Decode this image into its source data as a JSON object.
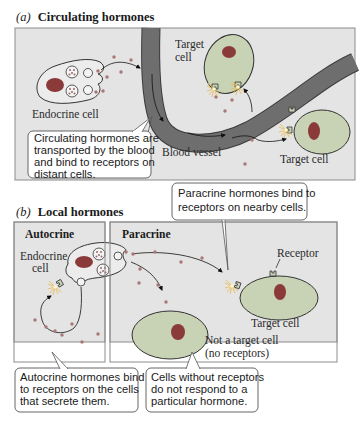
{
  "colors": {
    "panel_bg": "#e4e4e4",
    "panel_border": "#8c8c8c",
    "vessel": "#6e6e6e",
    "vessel_edge": "#3c3c3c",
    "cell_fill": "#c8d2b4",
    "endocrine_fill": "#ececec",
    "nucleus": "#8b3a3a",
    "hormone_dot": "#a87878",
    "callout_bg": "#ffffff",
    "callout_border": "#555555",
    "burst": "#f0c060"
  },
  "panel_a": {
    "letter": "(a)",
    "title": "Circulating hormones",
    "labels": {
      "endocrine_cell": "Endocrine cell",
      "target_cell_top_line1": "Target",
      "target_cell_top_line2": "cell",
      "blood_vessel": "Blood vessel",
      "target_cell_right": "Target cell"
    },
    "callout": {
      "lines": [
        "Circulating hormones are",
        "transported by the blood",
        "and bind to receptors on",
        "distant cells."
      ]
    }
  },
  "panel_b": {
    "letter": "(b)",
    "title": "Local hormones",
    "autocrine": {
      "title": "Autocrine",
      "endocrine_cell_line1": "Endocrine",
      "endocrine_cell_line2": "cell",
      "callout": {
        "lines": [
          "Autocrine hormones bind",
          "to receptors on the cells",
          "that secrete them."
        ]
      }
    },
    "paracrine": {
      "title": "Paracrine",
      "receptor_label": "Receptor",
      "target_cell": "Target cell",
      "non_target_line1": "Not a target cell",
      "non_target_line2": "(no receptors)",
      "callout_top": {
        "lines": [
          "Paracrine hormones bind to",
          "receptors on nearby cells."
        ]
      },
      "callout_bottom": {
        "lines": [
          "Cells without receptors",
          "do not respond to a",
          "particular hormone."
        ]
      }
    }
  }
}
